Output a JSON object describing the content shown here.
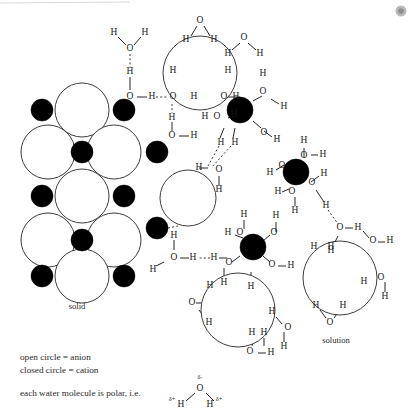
{
  "figure": {
    "title_hidden": "",
    "labels": {
      "solid": "solid",
      "solution": "solution"
    },
    "legend": {
      "line1": "open circle = anion",
      "line2": "closed circle = cation",
      "line3": "each water molecule is polar, i.e."
    },
    "polar_water": {
      "oxygen": "O",
      "hydrogen_left": "H",
      "hydrogen_right": "H",
      "delta_negative": "δ-",
      "delta_positive_left": "δ+",
      "delta_positive_right": "δ+"
    },
    "atom_labels": {
      "oxygen": "O",
      "hydrogen": "H"
    },
    "colors": {
      "anion_fill": "#ffffff",
      "anion_stroke": "#3d3d3d",
      "cation_fill": "#000000",
      "bond_stroke": "#262626",
      "hydrogen_bond_stroke": "#3a3a3a",
      "text": "#1a1a1a",
      "background": "#ffffff"
    },
    "lattice": {
      "anions": [
        {
          "cx": 82,
          "cy": 110,
          "r": 27
        },
        {
          "cx": 48,
          "cy": 152,
          "r": 27
        },
        {
          "cx": 114,
          "cy": 152,
          "r": 27
        },
        {
          "cx": 82,
          "cy": 196,
          "r": 27
        },
        {
          "cx": 48,
          "cy": 240,
          "r": 27
        },
        {
          "cx": 114,
          "cy": 240,
          "r": 27
        },
        {
          "cx": 82,
          "cy": 276,
          "r": 27
        }
      ],
      "cations": [
        {
          "cx": 42,
          "cy": 110,
          "r": 11
        },
        {
          "cx": 124,
          "cy": 110,
          "r": 11
        },
        {
          "cx": 82,
          "cy": 152,
          "r": 11
        },
        {
          "cx": 157,
          "cy": 152,
          "r": 11
        },
        {
          "cx": 42,
          "cy": 196,
          "r": 11
        },
        {
          "cx": 124,
          "cy": 196,
          "r": 11
        },
        {
          "cx": 82,
          "cy": 240,
          "r": 11
        },
        {
          "cx": 157,
          "cy": 228,
          "r": 11
        },
        {
          "cx": 42,
          "cy": 276,
          "r": 11
        },
        {
          "cx": 124,
          "cy": 276,
          "r": 11
        }
      ]
    },
    "solvated_species": {
      "dissolving_anion_top": {
        "cx": 200,
        "cy": 73,
        "r": 37
      },
      "dissolving_anion_mid": {
        "cx": 188,
        "cy": 198,
        "r": 28
      },
      "solvated_anion_bottom": {
        "cx": 238,
        "cy": 310,
        "r": 37
      },
      "solvated_anion_solution": {
        "cx": 340,
        "cy": 278,
        "r": 37
      },
      "solvated_cation_upper": {
        "cx": 240,
        "cy": 110,
        "r": 13
      },
      "solvated_cation_right": {
        "cx": 296,
        "cy": 172,
        "r": 13
      },
      "solvated_cation_lower": {
        "cx": 253,
        "cy": 247,
        "r": 13
      }
    },
    "counts": {
      "lattice_anions": 7,
      "lattice_cations": 10,
      "free_water_molecules": 28
    }
  }
}
